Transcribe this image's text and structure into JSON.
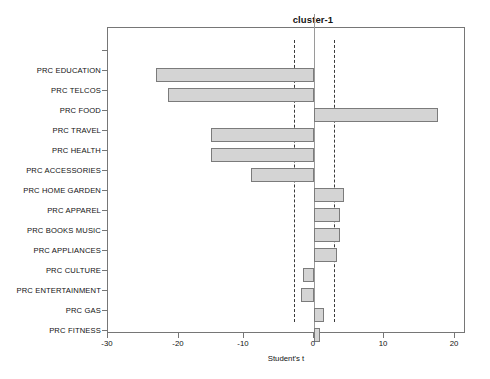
{
  "chart_data": {
    "type": "bar",
    "orientation": "horizontal",
    "title": "cluster-1",
    "xlabel": "Student's t",
    "ylabel": "",
    "xlim": [
      -32.5,
      18.3
    ],
    "xticks": [
      -30,
      -20,
      -10,
      0,
      10,
      20
    ],
    "xticklabels": [
      "-30",
      "-20",
      "-10",
      "0",
      "10",
      "20"
    ],
    "grid": false,
    "legend": null,
    "categories": [
      "PRC EDUCATION",
      "PRC TELCOS",
      "PRC FOOD",
      "PRC TRAVEL",
      "PRC HEALTH",
      "PRC ACCESSORIES",
      "PRC HOME GARDEN",
      "PRC APPAREL",
      "PRC BOOKS MUSIC",
      "PRC APPLIANCES",
      "PRC CULTURE",
      "PRC ENTERTAINMENT",
      "PRC GAS",
      "PRC FITNESS"
    ],
    "values": [
      -22.4,
      -20.7,
      17.6,
      -14.6,
      -14.6,
      -9.0,
      4.3,
      3.7,
      3.7,
      3.3,
      -1.6,
      -1.8,
      1.4,
      0.9
    ],
    "reference_lines": [
      {
        "name": "lower-threshold",
        "value": -2.9,
        "style": "dashed"
      },
      {
        "name": "upper-threshold",
        "value": 2.9,
        "style": "dashed"
      }
    ],
    "zero_line": {
      "name": "zero-axis",
      "value": 0,
      "style": "solid"
    },
    "bar_fill_color": "#d4d4d4",
    "bar_edge_color": "#7b7b7b",
    "reference_line_color": "#3a3a3a",
    "axis_color": "#767676"
  }
}
